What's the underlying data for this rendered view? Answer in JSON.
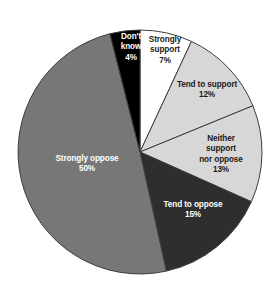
{
  "chart_data": {
    "type": "pie",
    "title": "",
    "subtitle": "",
    "xlabel": "",
    "ylabel": "",
    "legend_position": "none",
    "grid": false,
    "units": "percent",
    "total": 101,
    "start_angle_deg": 0,
    "direction": "clockwise",
    "categories": [
      "Strongly support",
      "Tend to support",
      "Neither support nor oppose",
      "Tend to oppose",
      "Strongly oppose",
      "Don't know"
    ],
    "values": [
      7,
      12,
      13,
      15,
      50,
      4
    ],
    "slices": [
      {
        "label": "Strongly support",
        "label_line1": "Strongly",
        "label_line2": "support",
        "value": 7,
        "value_text": "7%",
        "color": "#ffffff",
        "text_color": "#1a1a1a",
        "text_class": "on-light",
        "label_x": 165,
        "label_y": 51
      },
      {
        "label": "Tend to support",
        "label_line1": "Tend to support",
        "label_line2": "",
        "value": 12,
        "value_text": "12%",
        "color": "#d7d7d7",
        "text_color": "#1a1a1a",
        "text_class": "on-light",
        "label_x": 207,
        "label_y": 90
      },
      {
        "label": "Neither support nor oppose",
        "label_line1": "Neither support",
        "label_line2": "nor oppose",
        "value": 13,
        "value_text": "13%",
        "color": "#d7d7d7",
        "text_color": "#1a1a1a",
        "text_class": "on-light",
        "label_x": 221,
        "label_y": 155
      },
      {
        "label": "Tend to oppose",
        "label_line1": "Tend to oppose",
        "label_line2": "",
        "value": 15,
        "value_text": "15%",
        "color": "#2e2e2e",
        "text_color": "#ffffff",
        "text_class": "on-dark",
        "label_x": 193,
        "label_y": 210
      },
      {
        "label": "Strongly oppose",
        "label_line1": "Strongly oppose",
        "label_line2": "",
        "value": 50,
        "value_text": "50%",
        "color": "#777777",
        "text_color": "#ffffff",
        "text_class": "on-dark",
        "label_x": 87,
        "label_y": 164
      },
      {
        "label": "Don't know",
        "label_line1": "Don't",
        "label_line2": "know",
        "value": 4,
        "value_text": "4%",
        "color": "#000000",
        "text_color": "#ffffff",
        "text_class": "on-dark",
        "label_x": 131,
        "label_y": 48
      }
    ],
    "geometry": {
      "center_x": 140,
      "center_y": 152,
      "radius": 122
    },
    "colors": {
      "background": "#ffffff",
      "outline": "#3c3c3c",
      "strongly_support": "#ffffff",
      "tend_to_support": "#d7d7d7",
      "neither": "#d7d7d7",
      "tend_to_oppose": "#2e2e2e",
      "strongly_oppose": "#777777",
      "dont_know": "#000000"
    }
  }
}
